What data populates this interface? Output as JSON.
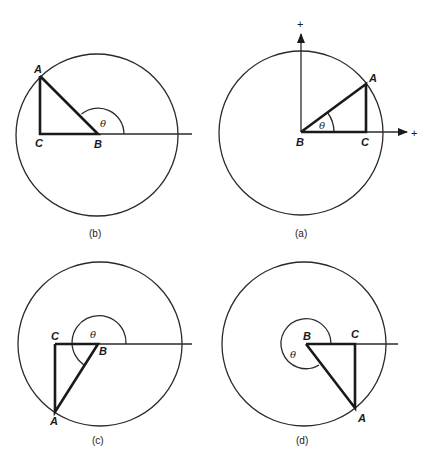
{
  "figure": {
    "panels": [
      {
        "id": "b",
        "caption": "(b)",
        "labels": {
          "A": "A",
          "B": "B",
          "C": "C",
          "theta": "θ"
        }
      },
      {
        "id": "a",
        "caption": "(a)",
        "labels": {
          "A": "A",
          "B": "B",
          "C": "C",
          "theta": "θ"
        },
        "axes": {
          "x_plus": "+",
          "y_plus": "+"
        }
      },
      {
        "id": "c",
        "caption": "(c)",
        "labels": {
          "A": "A",
          "B": "B",
          "C": "C",
          "theta": "θ"
        }
      },
      {
        "id": "d",
        "caption": "(d)",
        "labels": {
          "A": "A",
          "B": "B",
          "C": "C",
          "theta": "θ"
        }
      }
    ]
  }
}
